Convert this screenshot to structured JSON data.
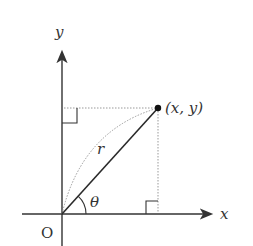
{
  "diagram": {
    "labels": {
      "y_axis": "y",
      "x_axis": "x",
      "origin": "O",
      "angle": "θ",
      "radius": "r",
      "point": "(x, y)"
    },
    "colors": {
      "axis": "#333333",
      "radius_line": "#2a2a2a",
      "dotted": "#999999",
      "point": "#111111",
      "background": "#ffffff"
    },
    "geometry": {
      "origin_px": [
        62,
        214
      ],
      "point_px": [
        158,
        108
      ]
    }
  }
}
